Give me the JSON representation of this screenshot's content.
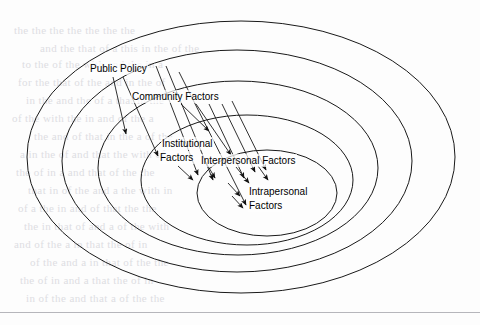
{
  "figure": {
    "type": "socio-ecological-model",
    "line_color": "#1a1a1a",
    "background_color": "#fdfdfd"
  },
  "rings": [
    {
      "id": "public-policy",
      "level": 1,
      "label": "Public Policy",
      "cx": 241,
      "cy": 157,
      "rx": 214,
      "ry": 136
    },
    {
      "id": "community",
      "level": 2,
      "label": "Community Factors",
      "cx": 237,
      "cy": 161,
      "rx": 175,
      "ry": 111
    },
    {
      "id": "institutional",
      "level": 3,
      "label": "Institutional Factors",
      "cx": 238,
      "cy": 168,
      "rx": 140,
      "ry": 87
    },
    {
      "id": "interpersonal",
      "level": 4,
      "label": "Interpersonal Factors",
      "cx": 247,
      "cy": 180,
      "rx": 106,
      "ry": 65
    },
    {
      "id": "intrapersonal",
      "level": 5,
      "label": "Intrapersonal Factors",
      "cx": 267,
      "cy": 193,
      "rx": 70,
      "ry": 43
    }
  ],
  "labels": {
    "public_policy": {
      "text": "Public Policy",
      "x": 89,
      "y": 62
    },
    "community": {
      "text": "Community Factors",
      "x": 131,
      "y": 90
    },
    "institutional_1": {
      "text": "Institutional",
      "x": 161,
      "y": 137
    },
    "institutional_2": {
      "text": "Factors",
      "x": 159,
      "y": 151
    },
    "interpersonal": {
      "text": "Interpersonal Factors",
      "x": 200,
      "y": 154
    },
    "intrapersonal_1": {
      "text": "Intrapersonal",
      "x": 248,
      "y": 185
    },
    "intrapersonal_2": {
      "text": "Factors",
      "x": 248,
      "y": 199
    }
  },
  "arrows": [
    {
      "id": "a1",
      "x1": 113,
      "y1": 77,
      "x2": 126,
      "y2": 134
    },
    {
      "id": "a2",
      "x1": 123,
      "y1": 77,
      "x2": 158,
      "y2": 156
    },
    {
      "id": "a3",
      "x1": 156,
      "y1": 66,
      "x2": 198,
      "y2": 175
    },
    {
      "id": "a4",
      "x1": 166,
      "y1": 66,
      "x2": 213,
      "y2": 180
    },
    {
      "id": "a5",
      "x1": 179,
      "y1": 72,
      "x2": 246,
      "y2": 205
    },
    {
      "id": "a6",
      "x1": 181,
      "y1": 104,
      "x2": 209,
      "y2": 131
    },
    {
      "id": "a7",
      "x1": 196,
      "y1": 104,
      "x2": 231,
      "y2": 155
    },
    {
      "id": "a8",
      "x1": 209,
      "y1": 104,
      "x2": 244,
      "y2": 178
    },
    {
      "id": "a9",
      "x1": 222,
      "y1": 104,
      "x2": 255,
      "y2": 172
    },
    {
      "id": "a10",
      "x1": 232,
      "y1": 101,
      "x2": 266,
      "y2": 170
    },
    {
      "id": "a11",
      "x1": 178,
      "y1": 166,
      "x2": 193,
      "y2": 180
    },
    {
      "id": "a12",
      "x1": 205,
      "y1": 161,
      "x2": 215,
      "y2": 178
    },
    {
      "id": "a13",
      "x1": 236,
      "y1": 167,
      "x2": 249,
      "y2": 183
    },
    {
      "id": "a14",
      "x1": 258,
      "y1": 166,
      "x2": 268,
      "y2": 180
    },
    {
      "id": "a15",
      "x1": 228,
      "y1": 183,
      "x2": 240,
      "y2": 196
    },
    {
      "id": "a16",
      "x1": 232,
      "y1": 196,
      "x2": 243,
      "y2": 208
    }
  ],
  "ghost_text": {
    "note": "faint scanner show-through text from reverse of page",
    "lines": [
      {
        "text": "the the the the the the the",
        "x": 14,
        "y": 24
      },
      {
        "text": "and the that of a this in the of the",
        "x": 40,
        "y": 42
      },
      {
        "text": "to the of the with and the in a",
        "x": 22,
        "y": 58
      },
      {
        "text": "for the that of the and in the of",
        "x": 18,
        "y": 76
      },
      {
        "text": "in the and the of a that in the",
        "x": 26,
        "y": 94
      },
      {
        "text": "of the with the in and of the a",
        "x": 12,
        "y": 112
      },
      {
        "text": "the and of that in the a of the",
        "x": 34,
        "y": 130
      },
      {
        "text": "a in the of and that the with of",
        "x": 20,
        "y": 148
      },
      {
        "text": "the of in a and that of the the",
        "x": 16,
        "y": 166
      },
      {
        "text": "that in of the and a the with in",
        "x": 28,
        "y": 184
      },
      {
        "text": "of a the in and of that the the",
        "x": 18,
        "y": 202
      },
      {
        "text": "the in that of and a of the with",
        "x": 24,
        "y": 220
      },
      {
        "text": "and of the a in that the of in",
        "x": 14,
        "y": 238
      },
      {
        "text": "of the and a in that of the the",
        "x": 30,
        "y": 256
      },
      {
        "text": "the of in and a that the of in",
        "x": 20,
        "y": 274
      },
      {
        "text": "in of the and that a of the the",
        "x": 26,
        "y": 292
      }
    ]
  },
  "bottom_rule": {
    "y": 312,
    "color": "#b6b6bb"
  }
}
